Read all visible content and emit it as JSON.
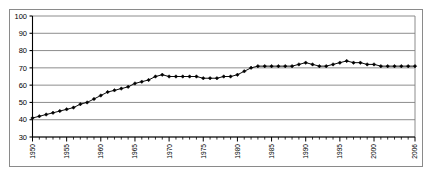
{
  "chart_data": {
    "type": "line",
    "title": "",
    "subtitle": "",
    "xlabel": "",
    "ylabel": "",
    "grid": true,
    "legend": false,
    "legend_position": "none",
    "marker": "filled-diamond",
    "line_color": "#000000",
    "marker_color": "#000000",
    "grid_color": "#808080",
    "axis_color": "#000000",
    "frame_color": "#8a8a8a",
    "background": "#ffffff",
    "xlim": [
      1950,
      2006
    ],
    "ylim": [
      30,
      100
    ],
    "yticks": [
      30,
      40,
      50,
      60,
      70,
      80,
      90,
      100
    ],
    "ytick_labels": [
      "30",
      "40",
      "50",
      "60",
      "70",
      "80",
      "90",
      "100"
    ],
    "xticks": [
      1950,
      1955,
      1960,
      1965,
      1970,
      1975,
      1980,
      1985,
      1990,
      1995,
      2000,
      2006
    ],
    "xtick_labels": [
      "1950",
      "1955",
      "1960",
      "1965",
      "1970",
      "1975",
      "1980",
      "1985",
      "1990",
      "1995",
      "2000",
      "2006"
    ],
    "xtick_label_rotation": -90,
    "xtick_minor_interval": 1,
    "x": [
      1950,
      1951,
      1952,
      1953,
      1954,
      1955,
      1956,
      1957,
      1958,
      1959,
      1960,
      1961,
      1962,
      1963,
      1964,
      1965,
      1966,
      1967,
      1968,
      1969,
      1970,
      1971,
      1972,
      1973,
      1974,
      1975,
      1976,
      1977,
      1978,
      1979,
      1980,
      1981,
      1982,
      1983,
      1984,
      1985,
      1986,
      1987,
      1988,
      1989,
      1990,
      1991,
      1992,
      1993,
      1994,
      1995,
      1996,
      1997,
      1998,
      1999,
      2000,
      2001,
      2002,
      2003,
      2004,
      2005,
      2006
    ],
    "values": [
      41,
      42,
      43,
      44,
      45,
      46,
      47,
      49,
      50,
      52,
      54,
      56,
      57,
      58,
      59,
      61,
      62,
      63,
      65,
      66,
      65,
      65,
      65,
      65,
      65,
      64,
      64,
      64,
      65,
      65,
      66,
      68,
      70,
      71,
      71,
      71,
      71,
      71,
      71,
      72,
      73,
      72,
      71,
      71,
      72,
      73,
      74,
      73,
      73,
      72,
      72,
      71,
      71,
      71,
      71,
      71,
      71
    ],
    "series": [
      {
        "name": "series-1",
        "values": [
          41,
          42,
          43,
          44,
          45,
          46,
          47,
          49,
          50,
          52,
          54,
          56,
          57,
          58,
          59,
          61,
          62,
          63,
          65,
          66,
          65,
          65,
          65,
          65,
          65,
          64,
          64,
          64,
          65,
          65,
          66,
          68,
          70,
          71,
          71,
          71,
          71,
          71,
          71,
          72,
          73,
          72,
          71,
          71,
          72,
          73,
          74,
          73,
          73,
          72,
          72,
          71,
          71,
          71,
          71,
          71,
          71
        ]
      }
    ]
  }
}
